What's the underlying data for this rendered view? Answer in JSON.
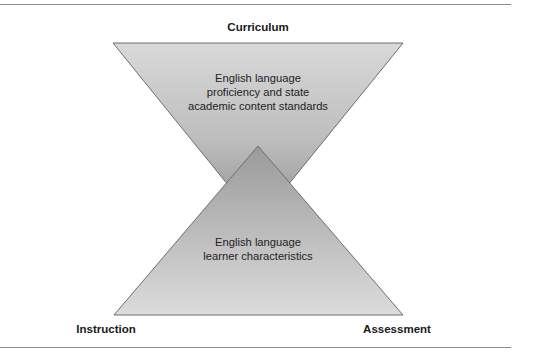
{
  "diagram": {
    "type": "overlapping-triangles (hourglass)",
    "top_label": "Curriculum",
    "bottom_left_label": "Instruction",
    "bottom_right_label": "Assessment",
    "inverted_triangle": {
      "lines": [
        "English language",
        "proficiency and state",
        "academic content standards"
      ]
    },
    "upright_triangle": {
      "lines": [
        "English language",
        "learner characteristics"
      ]
    },
    "colors": {
      "fill_light": "#d6d6d6",
      "fill_dark": "#9a9a9a",
      "stroke": "#6e6e6e",
      "rule": "#8a8a8a"
    }
  }
}
